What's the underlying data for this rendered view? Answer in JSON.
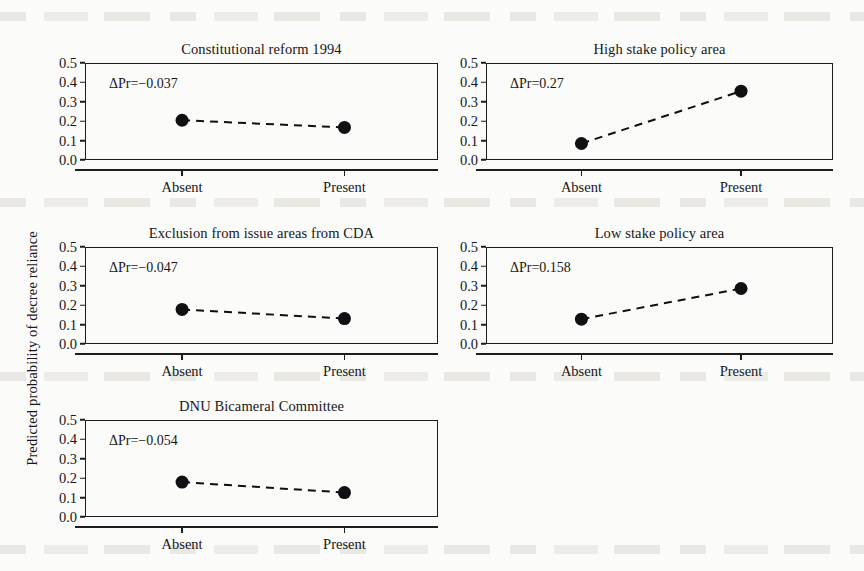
{
  "figure": {
    "ylabel": "Predicted probability of decree reliance",
    "ylim": [
      0.0,
      0.5
    ],
    "ytick_labels": [
      "0.0",
      "0.1",
      "0.2",
      "0.3",
      "0.4",
      "0.5"
    ],
    "categories": [
      "Absent",
      "Present"
    ]
  },
  "chart_data": {
    "type": "line",
    "title": "",
    "xlabel": "",
    "ylabel": "Predicted probability of decree reliance",
    "ylim": [
      0.0,
      0.5
    ],
    "yticks": [
      0.0,
      0.1,
      0.2,
      0.3,
      0.4,
      0.5
    ],
    "categories": [
      "Absent",
      "Present"
    ],
    "grid": false,
    "legend": "none",
    "layout": {
      "rows": 3,
      "cols": 2,
      "empty_cells": [
        "row3-col2"
      ]
    },
    "panels": [
      {
        "title": "Constitutional reform 1994",
        "annotation": "ΔPr=−0.037",
        "delta": -0.037,
        "values": [
          0.205,
          0.168
        ],
        "row": 1,
        "col": 1
      },
      {
        "title": "High stake policy area",
        "annotation": "ΔPr=0.27",
        "delta": 0.27,
        "values": [
          0.085,
          0.355
        ],
        "row": 1,
        "col": 2
      },
      {
        "title": "Exclusion from issue areas from CDA",
        "annotation": "ΔPr=−0.047",
        "delta": -0.047,
        "values": [
          0.178,
          0.131
        ],
        "row": 2,
        "col": 1
      },
      {
        "title": "Low stake policy area",
        "annotation": "ΔPr=0.158",
        "delta": 0.158,
        "values": [
          0.128,
          0.286
        ],
        "row": 2,
        "col": 2
      },
      {
        "title": "DNU Bicameral Committee",
        "annotation": "ΔPr=−0.054",
        "delta": -0.054,
        "values": [
          0.18,
          0.126
        ],
        "row": 3,
        "col": 1
      }
    ]
  },
  "geometry": {
    "panel_boxes": [
      {
        "x": 85,
        "y": 63,
        "w": 353,
        "h": 97
      },
      {
        "x": 486,
        "y": 63,
        "w": 347,
        "h": 97
      },
      {
        "x": 85,
        "y": 247,
        "w": 353,
        "h": 97
      },
      {
        "x": 486,
        "y": 247,
        "w": 347,
        "h": 97
      },
      {
        "x": 85,
        "y": 420,
        "w": 353,
        "h": 97
      }
    ],
    "marker_radius": 6.5,
    "x_positions_frac": [
      0.275,
      0.735
    ],
    "axis_offset": 9,
    "axis_left_overhang": 10
  }
}
